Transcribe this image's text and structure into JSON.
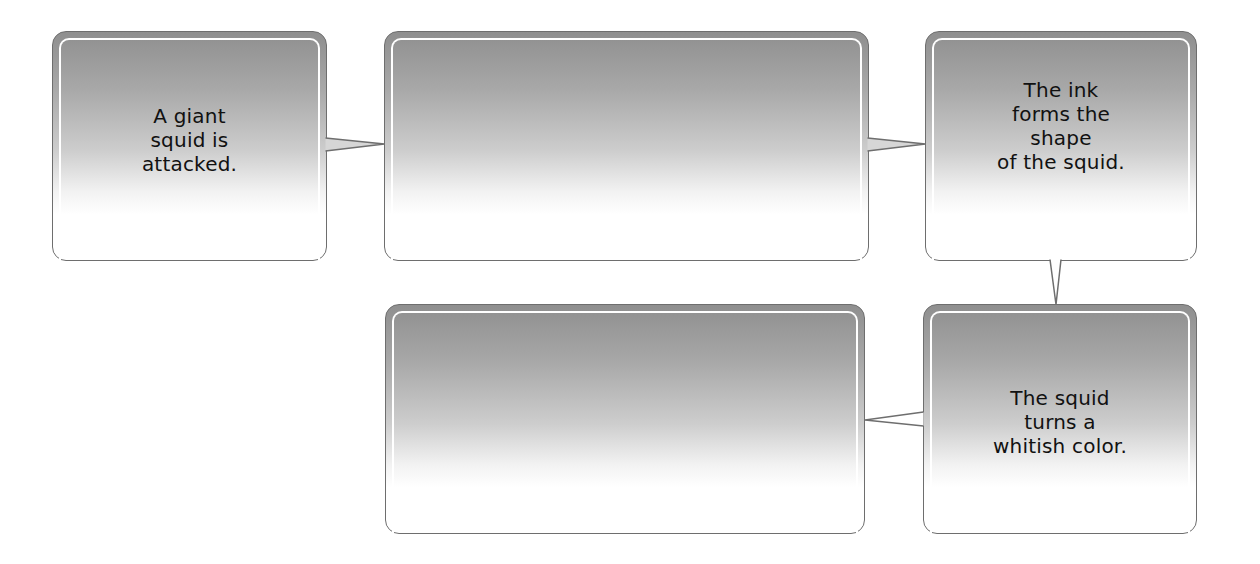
{
  "diagram": {
    "type": "flow-chart",
    "nodes": [
      {
        "id": "box1",
        "text": "A giant\nsquid is\nattacked.",
        "filled": true
      },
      {
        "id": "box2",
        "text": "",
        "filled": false
      },
      {
        "id": "box3",
        "text": "The ink\nforms the\nshape\nof the squid.",
        "filled": true
      },
      {
        "id": "box4",
        "text": "",
        "filled": false
      },
      {
        "id": "box5",
        "text": "The squid\nturns a\nwhitish color.",
        "filled": true
      }
    ],
    "edges": [
      {
        "from": "box1",
        "to": "box2"
      },
      {
        "from": "box2",
        "to": "box3"
      },
      {
        "from": "box3",
        "to": "box5"
      },
      {
        "from": "box5",
        "to": "box4"
      }
    ]
  },
  "colors": {
    "border": "#6e6e6e",
    "gradient_top": "#8f8f8f",
    "gradient_bottom": "#ffffff",
    "text": "#111111"
  }
}
